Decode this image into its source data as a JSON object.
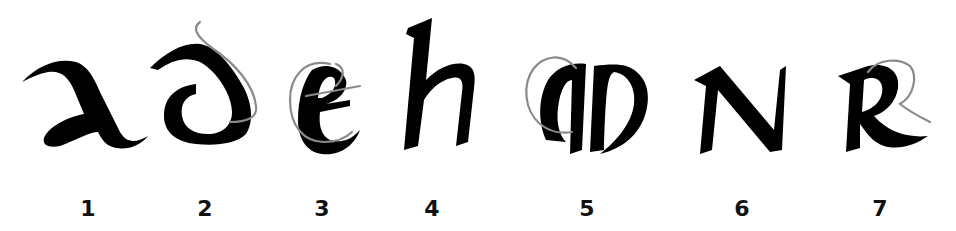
{
  "figure": {
    "letters": [
      {
        "number": "1",
        "glyph": "a (uncial)",
        "x": 88,
        "has_guide": false
      },
      {
        "number": "2",
        "glyph": "d (uncial)",
        "x": 205,
        "has_guide": true
      },
      {
        "number": "3",
        "glyph": "e",
        "x": 322,
        "has_guide": true
      },
      {
        "number": "4",
        "glyph": "h",
        "x": 432,
        "has_guide": false
      },
      {
        "number": "5",
        "glyph": "m (uncial)",
        "x": 587,
        "has_guide": true
      },
      {
        "number": "6",
        "glyph": "N",
        "x": 742,
        "has_guide": false
      },
      {
        "number": "7",
        "glyph": "R",
        "x": 880,
        "has_guide": true
      }
    ]
  },
  "colors": {
    "ink": "#000000",
    "guide": "#8a8a8a",
    "background": "#ffffff"
  }
}
